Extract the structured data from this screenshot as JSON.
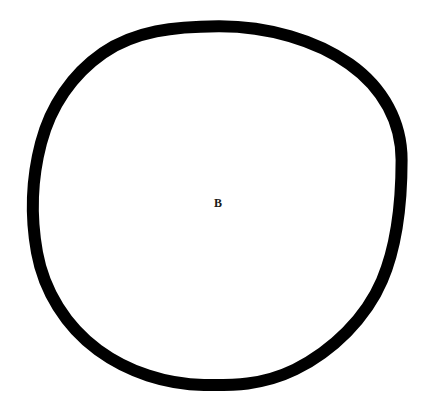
{
  "figure": {
    "background_color": "#ffffff",
    "width": 432,
    "height": 409
  },
  "shapes": [
    {
      "name": "outer-circle",
      "type": "ellipse",
      "stroke_color": "#000000",
      "fill_color": "none",
      "stroke_width": 12,
      "center_x": 218.5,
      "center_y": 205.5,
      "radius_x": 182,
      "radius_y": 179,
      "bounds": {
        "left": 30,
        "top": 20,
        "right": 407,
        "bottom": 391
      }
    }
  ],
  "labels": [
    {
      "name": "region-label-b",
      "text": "B",
      "x": 218,
      "y": 203,
      "font_size": 12,
      "font_weight": "bold",
      "color": "#1a1a1a",
      "region": "interior"
    }
  ]
}
